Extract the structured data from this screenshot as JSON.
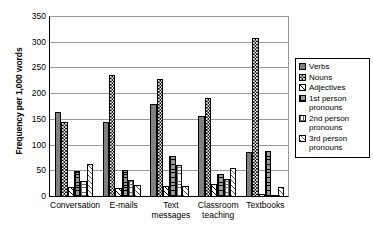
{
  "chart_data": {
    "type": "bar",
    "title": "",
    "xlabel": "",
    "ylabel": "Frequency per 1,000 words",
    "ylim": [
      0,
      350
    ],
    "yticks": [
      0,
      50,
      100,
      150,
      200,
      250,
      300,
      350
    ],
    "grid": true,
    "legend_position": "right",
    "categories": [
      "Conversation",
      "E-mails",
      "Text messages",
      "Classroom teaching",
      "Textbooks"
    ],
    "series": [
      {
        "name": "Verbs",
        "values": [
          165,
          145,
          180,
          158,
          88
        ]
      },
      {
        "name": "Nouns",
        "values": [
          145,
          237,
          230,
          192,
          310
        ]
      },
      {
        "name": "Adjectives",
        "values": [
          20,
          18,
          22,
          25,
          5
        ]
      },
      {
        "name": "1st person pronouns",
        "values": [
          50,
          52,
          79,
          45,
          90
        ]
      },
      {
        "name": "2nd person pronouns",
        "values": [
          32,
          33,
          62,
          35,
          4
        ]
      },
      {
        "name": "3rd person pronouns",
        "values": [
          65,
          23,
          21,
          57,
          20
        ]
      }
    ]
  },
  "legend": {
    "items": [
      {
        "label": "Verbs",
        "swatch": "solid-gray-swatch"
      },
      {
        "label": "Nouns",
        "swatch": "checkerboard-swatch"
      },
      {
        "label": "Adjectives",
        "swatch": "light-diagonal-swatch"
      },
      {
        "label": "1st person pronouns",
        "swatch": "dark-dotted-swatch"
      },
      {
        "label": "2nd person pronouns",
        "swatch": "light-dotted-swatch"
      },
      {
        "label": "3rd person pronouns",
        "swatch": "diagonal-hatch-swatch"
      }
    ]
  }
}
